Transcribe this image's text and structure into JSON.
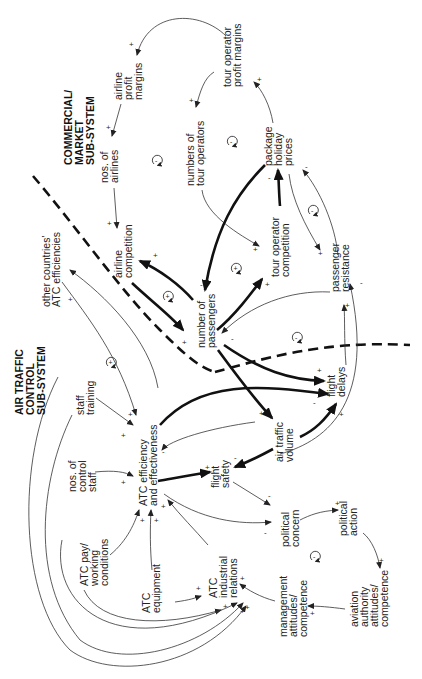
{
  "diagram": {
    "type": "causal-loop-diagram",
    "orientation": "rotated 90 degrees clockwise",
    "subsystems": [
      {
        "id": "commercial",
        "label_lines": [
          "COMMERCIAL/",
          "MARKET",
          "SUB-SYSTEM"
        ]
      },
      {
        "id": "atc",
        "label_lines": [
          "AIR TRAFFIC",
          "CONTROL",
          "SUB-SYSTEM"
        ]
      }
    ],
    "nodes": {
      "airline_profit_margins": {
        "lines": [
          "airline",
          "profit",
          "margins"
        ]
      },
      "nos_of_airlines": {
        "lines": [
          "nos. of",
          "airlines"
        ]
      },
      "airline_competition": {
        "lines": [
          "airline",
          "competition"
        ]
      },
      "tour_operator_profit_margins": {
        "lines": [
          "tour operator",
          "profit margins"
        ]
      },
      "numbers_of_tour_operators": {
        "lines": [
          "numbers of",
          "tour operators"
        ]
      },
      "package_holiday_prices": {
        "lines": [
          "package",
          "holiday",
          "prices"
        ]
      },
      "tour_operator_competition": {
        "lines": [
          "tour operator",
          "competition"
        ]
      },
      "passenger_resistance": {
        "lines": [
          "passenger",
          "resistance"
        ]
      },
      "number_of_passengers": {
        "lines": [
          "number of",
          "passengers"
        ]
      },
      "other_countries_atc": {
        "lines": [
          "other countries'",
          "ATC efficiencies"
        ]
      },
      "flight_delays": {
        "lines": [
          "flight",
          "delays"
        ]
      },
      "air_traffic_volume": {
        "lines": [
          "air traffic",
          "volume"
        ]
      },
      "staff_training": {
        "lines": [
          "staff",
          "training"
        ]
      },
      "atc_efficiency": {
        "lines": [
          "ATC efficiency",
          "and effectiveness"
        ]
      },
      "flight_safety": {
        "lines": [
          "flight",
          "safety"
        ]
      },
      "nos_of_control_staff": {
        "lines": [
          "nos. of",
          "control",
          "staff"
        ]
      },
      "atc_pay": {
        "lines": [
          "ATC pay/",
          "working",
          "conditions"
        ]
      },
      "political_concern": {
        "lines": [
          "political",
          "concern"
        ]
      },
      "political_action": {
        "lines": [
          "political",
          "action"
        ]
      },
      "atc_equipment": {
        "lines": [
          "ATC",
          "equipment"
        ]
      },
      "atc_industrial_relations": {
        "lines": [
          "ATC",
          "industrial",
          "relations"
        ]
      },
      "management_attitudes": {
        "lines": [
          "management",
          "attitudes/",
          "competence"
        ]
      },
      "aviation_authority": {
        "lines": [
          "aviation",
          "authority",
          "attitudes/",
          "competence"
        ]
      }
    },
    "links": [
      {
        "from": "tour_operator_profit_margins",
        "to": "airline_profit_margins",
        "sign": "+"
      },
      {
        "from": "airline_profit_margins",
        "to": "nos_of_airlines",
        "sign": "+"
      },
      {
        "from": "nos_of_airlines",
        "to": "airline_competition",
        "sign": "+"
      },
      {
        "from": "tour_operator_profit_margins",
        "to": "numbers_of_tour_operators",
        "sign": "+"
      },
      {
        "from": "numbers_of_tour_operators",
        "to": "tour_operator_competition",
        "sign": "+"
      },
      {
        "from": "package_holiday_prices",
        "to": "tour_operator_profit_margins",
        "sign": "+"
      },
      {
        "from": "tour_operator_competition",
        "to": "package_holiday_prices",
        "sign": "-",
        "weight": "thick"
      },
      {
        "from": "package_holiday_prices",
        "to": "passenger_resistance",
        "sign": "+"
      },
      {
        "from": "passenger_resistance",
        "to": "package_holiday_prices",
        "sign": "-"
      },
      {
        "from": "package_holiday_prices",
        "to": "number_of_passengers",
        "sign": "-",
        "weight": "thick"
      },
      {
        "from": "number_of_passengers",
        "to": "airline_competition",
        "sign": "+",
        "weight": "thick"
      },
      {
        "from": "airline_competition",
        "to": "number_of_passengers",
        "sign": "+",
        "weight": "thick"
      },
      {
        "from": "number_of_passengers",
        "to": "tour_operator_competition",
        "sign": "+",
        "weight": "thick"
      },
      {
        "from": "passenger_resistance",
        "to": "number_of_passengers",
        "sign": "-"
      },
      {
        "from": "flight_delays",
        "to": "passenger_resistance",
        "sign": "+"
      },
      {
        "from": "air_traffic_volume",
        "to": "passenger_resistance",
        "sign": "-"
      },
      {
        "from": "number_of_passengers",
        "to": "flight_delays",
        "sign": "+",
        "weight": "thick"
      },
      {
        "from": "number_of_passengers",
        "to": "air_traffic_volume",
        "sign": "+",
        "weight": "thick"
      },
      {
        "from": "atc_efficiency",
        "to": "flight_delays",
        "sign": "-",
        "weight": "thick"
      },
      {
        "from": "air_traffic_volume",
        "to": "flight_delays",
        "sign": "+",
        "weight": "thick"
      },
      {
        "from": "atc_efficiency",
        "to": "other_countries_atc",
        "sign": "+"
      },
      {
        "from": "other_countries_atc",
        "to": "atc_efficiency",
        "sign": "+"
      },
      {
        "from": "staff_training",
        "to": "atc_efficiency",
        "sign": "+"
      },
      {
        "from": "air_traffic_volume",
        "to": "atc_efficiency",
        "sign": "-"
      },
      {
        "from": "atc_efficiency",
        "to": "flight_safety",
        "sign": "+",
        "weight": "thick"
      },
      {
        "from": "air_traffic_volume",
        "to": "flight_safety",
        "sign": "-",
        "weight": "thick"
      },
      {
        "from": "nos_of_control_staff",
        "to": "atc_efficiency",
        "sign": "+"
      },
      {
        "from": "atc_pay",
        "to": "atc_efficiency",
        "sign": "+"
      },
      {
        "from": "atc_equipment",
        "to": "atc_efficiency",
        "sign": "+"
      },
      {
        "from": "atc_industrial_relations",
        "to": "atc_efficiency",
        "sign": "+"
      },
      {
        "from": "flight_safety",
        "to": "political_concern",
        "sign": "-"
      },
      {
        "from": "atc_efficiency",
        "to": "political_concern",
        "sign": "-"
      },
      {
        "from": "political_concern",
        "to": "political_action",
        "sign": "+"
      },
      {
        "from": "political_action",
        "to": "aviation_authority",
        "sign": "+"
      },
      {
        "from": "aviation_authority",
        "to": "management_attitudes",
        "sign": "+"
      },
      {
        "from": "management_attitudes",
        "to": "atc_industrial_relations",
        "sign": "+"
      },
      {
        "from": "atc_equipment",
        "to": "atc_industrial_relations",
        "sign": "+"
      },
      {
        "from": "atc_pay",
        "to": "atc_industrial_relations",
        "sign": "+"
      },
      {
        "from": "nos_of_control_staff",
        "to": "atc_industrial_relations",
        "sign": "+"
      },
      {
        "from": "staff_training",
        "to": "atc_industrial_relations",
        "sign": "+"
      }
    ],
    "loop_markers": [
      {
        "id": "loop-airlines",
        "sign": "-"
      },
      {
        "id": "loop-tour-operators",
        "sign": "-"
      },
      {
        "id": "loop-passenger-resistance",
        "sign": "-"
      },
      {
        "id": "loop-airline-competition",
        "sign": "+"
      },
      {
        "id": "loop-tour-op-competition",
        "sign": "+"
      },
      {
        "id": "loop-other-countries",
        "sign": "+"
      },
      {
        "id": "loop-flight-delays",
        "sign": "-"
      },
      {
        "id": "loop-political",
        "sign": "-"
      }
    ],
    "signs": {
      "plus": "+",
      "minus": "-"
    }
  }
}
